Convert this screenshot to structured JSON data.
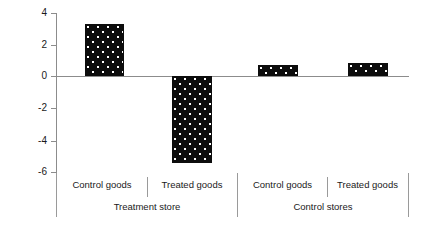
{
  "chart_data": {
    "type": "bar",
    "title": "",
    "subtitle": "",
    "xlabel": "",
    "ylabel": "Percentage change in demand",
    "ylim": [
      -6.8,
      4.0
    ],
    "yticks": [
      4,
      2,
      0,
      -2,
      -4,
      -6
    ],
    "ytick_labels": [
      "4",
      "2",
      "0",
      "-2",
      "-4",
      "-6"
    ],
    "grid": false,
    "legend": "none",
    "zero_line": 0,
    "categories": [
      "Control goods",
      "Treated goods",
      "Control goods",
      "Treated goods"
    ],
    "groups": [
      {
        "label": "Treatment store",
        "categories": [
          "Control goods",
          "Treated goods"
        ]
      },
      {
        "label": "Control stores",
        "categories": [
          "Control goods",
          "Treated goods"
        ]
      }
    ],
    "values": [
      3.2,
      -5.4,
      0.7,
      0.8
    ],
    "series": [
      {
        "name": "Percentage change in demand",
        "values": [
          3.2,
          -5.4,
          0.7,
          0.8
        ],
        "color": "#0d0d0d",
        "pattern": "dotted-fill"
      }
    ],
    "bars": [
      {
        "group": "Treatment store",
        "category": "Control goods",
        "value": 3.2
      },
      {
        "group": "Treatment store",
        "category": "Treated goods",
        "value": -5.4
      },
      {
        "group": "Control stores",
        "category": "Control goods",
        "value": 0.7
      },
      {
        "group": "Control stores",
        "category": "Treated goods",
        "value": 0.8
      }
    ]
  },
  "axis": {
    "y_title": "Percentage change in demand",
    "ticks": [
      {
        "label": "4"
      },
      {
        "label": "2"
      },
      {
        "label": "0"
      },
      {
        "label": "-2"
      },
      {
        "label": "-4"
      },
      {
        "label": "-6"
      }
    ]
  },
  "category_axis": {
    "items": [
      {
        "label": "Control goods"
      },
      {
        "label": "Treated goods"
      },
      {
        "label": "Control goods"
      },
      {
        "label": "Treated goods"
      }
    ],
    "groups": [
      {
        "label": "Treatment store"
      },
      {
        "label": "Control stores"
      }
    ]
  },
  "colors": {
    "bar_fill": "#0d0d0d",
    "bar_pattern": "#ffffff",
    "axis": "#8c8c8c",
    "text": "#1a1a1a",
    "background": "#ffffff"
  }
}
